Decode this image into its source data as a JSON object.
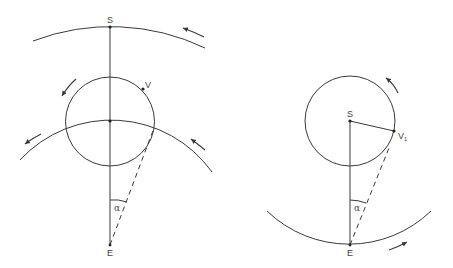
{
  "figure": {
    "left_diagram": {
      "description": "Epicycle model: planet V on epicycle centered on deferent, observed from Earth E; Sun S on outer orbit",
      "labels": {
        "sun": "S",
        "planet": "V",
        "earth": "E",
        "angle": "α"
      }
    },
    "right_diagram": {
      "description": "Heliocentric model: planet V1 orbiting Sun S, Earth E on its orbit",
      "labels": {
        "sun": "S",
        "planet": "V",
        "planet_subscript": "1",
        "earth": "E",
        "angle": "α"
      }
    },
    "colors": {
      "line": "#3a3a3a",
      "text": "#444444",
      "background": "#ffffff"
    }
  }
}
